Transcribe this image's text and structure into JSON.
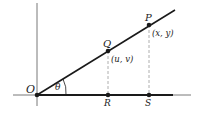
{
  "diagram": {
    "colors": {
      "line": "#1a1a1a",
      "dashed": "#9a9a9a",
      "background": "#ffffff"
    },
    "points": {
      "O": {
        "label": "O"
      },
      "Q": {
        "label": "Q",
        "coords": "(u, v)"
      },
      "P": {
        "label": "P",
        "coords": "(x, y)"
      },
      "R": {
        "label": "R"
      },
      "S": {
        "label": "S"
      }
    },
    "angle": {
      "label": "θ"
    }
  }
}
